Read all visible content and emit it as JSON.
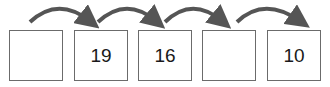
{
  "sequence": {
    "boxes": [
      {
        "value": ""
      },
      {
        "value": "19"
      },
      {
        "value": "16"
      },
      {
        "value": ""
      },
      {
        "value": "10"
      }
    ],
    "arrow_color": "#555555",
    "box_border_color": "#6b6b6b"
  }
}
